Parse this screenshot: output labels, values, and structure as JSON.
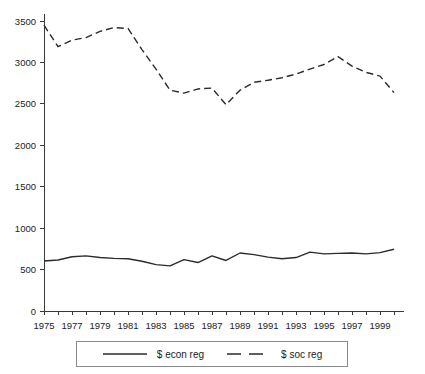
{
  "chart_data": {
    "type": "line",
    "title": "",
    "subtitle": "",
    "xlabel": "",
    "ylabel": "",
    "xlim": [
      1975,
      2000
    ],
    "ylim": [
      0,
      3500
    ],
    "grid": false,
    "legend_position": "bottom",
    "x": [
      1975,
      1976,
      1977,
      1978,
      1979,
      1980,
      1981,
      1982,
      1983,
      1984,
      1985,
      1986,
      1987,
      1988,
      1989,
      1990,
      1991,
      1992,
      1993,
      1994,
      1995,
      1996,
      1997,
      1998,
      1999,
      2000
    ],
    "xtick_labels": [
      "1975",
      "1977",
      "1979",
      "1981",
      "1983",
      "1985",
      "1987",
      "1989",
      "1991",
      "1993",
      "1995",
      "1997",
      "1999"
    ],
    "xtick_values": [
      1975,
      1977,
      1979,
      1981,
      1983,
      1985,
      1987,
      1989,
      1991,
      1993,
      1995,
      1997,
      1999
    ],
    "ytick_labels": [
      "0",
      "500",
      "1000",
      "1500",
      "2000",
      "2500",
      "3000",
      "3500"
    ],
    "ytick_values": [
      0,
      500,
      1000,
      1500,
      2000,
      2500,
      3000,
      3500
    ],
    "series": [
      {
        "name": "$ econ reg",
        "style": "solid",
        "color": "#2b2b2b",
        "values": [
          603,
          615,
          655,
          665,
          645,
          635,
          630,
          600,
          560,
          545,
          620,
          585,
          665,
          610,
          700,
          680,
          650,
          630,
          645,
          710,
          690,
          695,
          700,
          690,
          705,
          745
        ]
      },
      {
        "name": "$ soc reg",
        "style": "dashed",
        "color": "#2b2b2b",
        "values": [
          3450,
          3190,
          3270,
          3300,
          3375,
          3420,
          3410,
          3155,
          2920,
          2665,
          2630,
          2680,
          2690,
          2490,
          2665,
          2760,
          2785,
          2815,
          2860,
          2920,
          2975,
          3070,
          2955,
          2880,
          2835,
          2635
        ]
      }
    ],
    "series_corrected": [
      {
        "name": "$ econ reg",
        "style": "solid",
        "values": [
          603,
          615,
          655,
          665,
          645,
          635,
          630,
          600,
          560,
          545,
          620,
          585,
          665,
          610,
          700,
          680,
          650,
          630,
          645,
          710,
          690,
          695,
          700,
          690,
          705,
          745
        ]
      },
      {
        "name": "$ soc reg",
        "style": "dashed",
        "values": [
          3450,
          3190,
          3270,
          3300,
          3375,
          3420,
          3410,
          3155,
          2920,
          2665,
          2630,
          2680,
          2690,
          2490,
          2665,
          2760,
          2785,
          2815,
          2860,
          2920,
          2975,
          3070,
          2955,
          2880,
          2835,
          2635
        ]
      }
    ]
  },
  "legend": {
    "items": [
      {
        "label": "$ econ reg",
        "style": "solid"
      },
      {
        "label": "$ soc reg",
        "style": "dashed"
      }
    ]
  },
  "colors": {
    "line": "#2b2b2b",
    "axis": "#3a3a3a",
    "background": "#ffffff",
    "legend_border": "#8a8a8a"
  }
}
